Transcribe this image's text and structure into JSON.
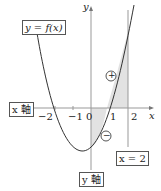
{
  "labels": {
    "func": "y = f(x)",
    "x_axis_box": "x 軸",
    "y_axis_box": "y 軸",
    "line_box": "x = 2",
    "y_axis_letter": "y",
    "x_axis_letter": "x",
    "plus": "+",
    "minus": "−"
  },
  "ticks": [
    {
      "label": "−2",
      "value": -2
    },
    {
      "label": "−1",
      "value": -1
    },
    {
      "label": "0",
      "value": 0
    },
    {
      "label": "1",
      "value": 1
    },
    {
      "label": "2",
      "value": 2
    }
  ],
  "colors": {
    "axis": "#999999",
    "curve": "#333333",
    "shade": "#dddddd"
  }
}
